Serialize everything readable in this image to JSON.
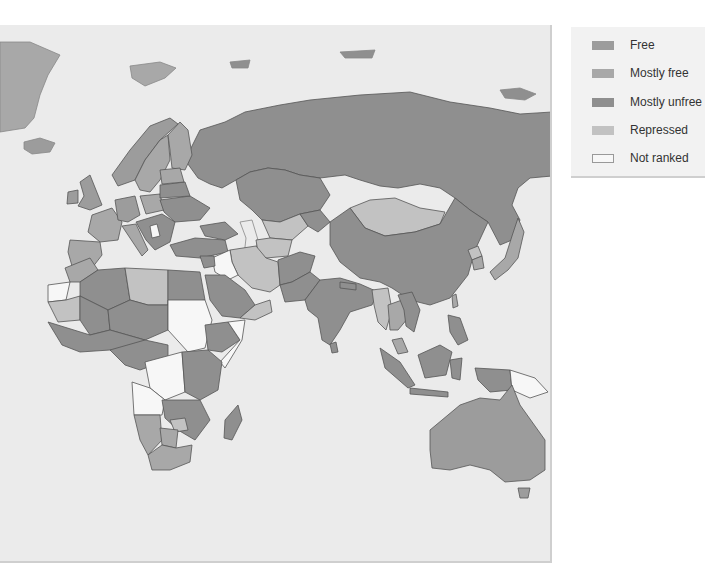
{
  "map": {
    "subject": "Eurasia, Africa and Oceania economic freedom choropleth",
    "colors": {
      "sea": "#ebebeb",
      "border": "#555555",
      "free": "#9c9c9c",
      "mostly_free": "#a8a8a8",
      "mostly_unfree": "#8f8f8f",
      "repressed": "#c2c2c2",
      "not_ranked": "#f7f7f7"
    },
    "regions": [
      {
        "name": "Russia",
        "category": "mostly_unfree"
      },
      {
        "name": "China",
        "category": "mostly_unfree"
      },
      {
        "name": "Mongolia",
        "category": "repressed"
      },
      {
        "name": "Kazakhstan",
        "category": "mostly_unfree"
      },
      {
        "name": "Iran",
        "category": "repressed"
      },
      {
        "name": "Iraq",
        "category": "not_ranked"
      },
      {
        "name": "India",
        "category": "mostly_unfree"
      },
      {
        "name": "Japan",
        "category": "mostly_free"
      },
      {
        "name": "South Korea",
        "category": "mostly_free"
      },
      {
        "name": "Australia",
        "category": "free"
      },
      {
        "name": "Sudan",
        "category": "not_ranked"
      },
      {
        "name": "DR Congo",
        "category": "not_ranked"
      },
      {
        "name": "Angola",
        "category": "not_ranked"
      },
      {
        "name": "Somalia",
        "category": "not_ranked"
      },
      {
        "name": "Western Sahara",
        "category": "not_ranked"
      },
      {
        "name": "Libya",
        "category": "repressed"
      },
      {
        "name": "Algeria",
        "category": "mostly_unfree"
      },
      {
        "name": "South Africa",
        "category": "mostly_free"
      },
      {
        "name": "Papua New Guinea",
        "category": "not_ranked"
      },
      {
        "name": "Serbia",
        "category": "not_ranked"
      },
      {
        "name": "Europe (west)",
        "category": "mostly_free"
      },
      {
        "name": "Greenland",
        "category": "mostly_free"
      },
      {
        "name": "Iceland",
        "category": "free"
      }
    ]
  },
  "legend": {
    "items": [
      {
        "label": "Free",
        "color": "#9c9c9c"
      },
      {
        "label": "Mostly free",
        "color": "#a8a8a8"
      },
      {
        "label": "Mostly unfree",
        "color": "#8f8f8f"
      },
      {
        "label": "Repressed",
        "color": "#c2c2c2"
      },
      {
        "label": "Not ranked",
        "color": "#f7f7f7"
      }
    ]
  }
}
